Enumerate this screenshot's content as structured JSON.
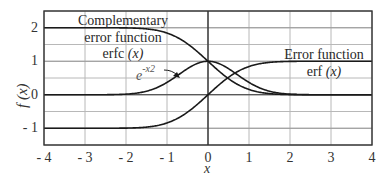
{
  "chart_data": {
    "type": "line",
    "title": "",
    "xlabel": "x",
    "ylabel": "f (x)",
    "xlim": [
      -4,
      4
    ],
    "ylim": [
      -1.5,
      2.5
    ],
    "grid": true,
    "x_ticks": [
      "- 4",
      "- 3",
      "- 2",
      "- 1",
      "0",
      "1",
      "2",
      "3",
      "4"
    ],
    "y_ticks": [
      "2",
      "1",
      "0",
      "- 1"
    ],
    "x": [
      -4,
      -3.5,
      -3,
      -2.5,
      -2,
      -1.75,
      -1.5,
      -1.25,
      -1,
      -0.75,
      -0.5,
      -0.25,
      0,
      0.25,
      0.5,
      0.75,
      1,
      1.25,
      1.5,
      1.75,
      2,
      2.5,
      3,
      3.5,
      4
    ],
    "series": [
      {
        "name": "erfc (x)",
        "values": [
          2.0,
          2.0,
          2.0,
          2.0,
          1.995,
          1.987,
          1.966,
          1.923,
          1.843,
          1.711,
          1.52,
          1.276,
          1.0,
          0.724,
          0.48,
          0.289,
          0.157,
          0.077,
          0.034,
          0.013,
          0.005,
          0.0,
          0.0,
          0.0,
          0.0
        ]
      },
      {
        "name": "erf (x)",
        "values": [
          -1.0,
          -1.0,
          -1.0,
          -1.0,
          -0.995,
          -0.987,
          -0.966,
          -0.923,
          -0.843,
          -0.711,
          -0.52,
          -0.276,
          0.0,
          0.276,
          0.52,
          0.711,
          0.843,
          0.923,
          0.966,
          0.987,
          0.995,
          1.0,
          1.0,
          1.0,
          1.0
        ]
      },
      {
        "name": "e^(-x^2)",
        "values": [
          0.0,
          0.0,
          0.0,
          0.002,
          0.018,
          0.047,
          0.105,
          0.21,
          0.368,
          0.57,
          0.779,
          0.939,
          1.0,
          0.939,
          0.779,
          0.57,
          0.368,
          0.21,
          0.105,
          0.047,
          0.018,
          0.002,
          0.0,
          0.0,
          0.0
        ]
      }
    ],
    "annotations": [
      {
        "text_lines": [
          "Complementary",
          "error function",
          "erfc (x)"
        ]
      },
      {
        "text_lines": [
          "Error function",
          "erf (x)"
        ]
      },
      {
        "text": "e -x2",
        "arrow_to": "gaussian curve"
      }
    ]
  },
  "labels": {
    "erfc_line1": "Complementary",
    "erfc_line2": "error function",
    "erfc_line3_fn": "erfc",
    "erfc_line3_arg": "(x)",
    "erf_line1": "Error function",
    "erf_line2_fn": "erf",
    "erf_line2_arg": "(x)",
    "gauss_base": "e",
    "gauss_exp": "-x2",
    "xlabel": "x",
    "ylabel": "f (x)"
  },
  "colors": {
    "curve": "#1a1a1a",
    "grid": "#b8b8b8",
    "frame": "#333333",
    "axis_zero": "#333333",
    "text": "#333333"
  }
}
